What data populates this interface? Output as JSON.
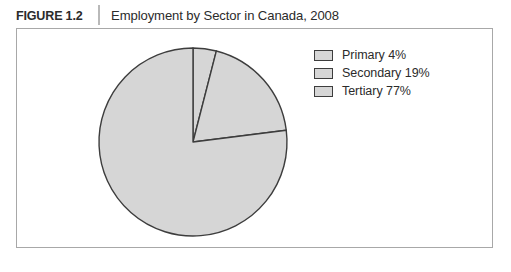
{
  "figure": {
    "number_label": "FIGURE 1.2",
    "title": "Employment by Sector in Canada, 2008"
  },
  "legend": {
    "items": [
      {
        "label": "Primary 4%",
        "swatch_color": "#d6d6d6"
      },
      {
        "label": "Secondary 19%",
        "swatch_color": "#d6d6d6"
      },
      {
        "label": "Tertiary 77%",
        "swatch_color": "#d6d6d6"
      }
    ]
  },
  "colors": {
    "slice_fill": "#d6d6d6",
    "slice_stroke": "#3d3d3d",
    "frame_border": "#a8a8a8",
    "text": "#2b2b2b",
    "header_divider": "#b9b9b9"
  },
  "chart_data": {
    "type": "pie",
    "title": "Employment by Sector in Canada, 2008",
    "categories": [
      "Primary",
      "Secondary",
      "Tertiary"
    ],
    "values": [
      4,
      19,
      77
    ],
    "value_unit": "%",
    "labels": [
      "Primary 4%",
      "Secondary 19%",
      "Tertiary 77%"
    ],
    "slice_colors": [
      "#d6d6d6",
      "#d6d6d6",
      "#d6d6d6"
    ],
    "start_angle_deg": 0,
    "direction": "clockwise",
    "legend_position": "right",
    "grid": false,
    "xlabel": "",
    "ylabel": "",
    "geometry": {
      "cx": 193,
      "cy": 142,
      "r": 94
    }
  }
}
